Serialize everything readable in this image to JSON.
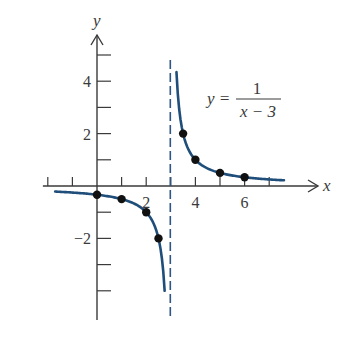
{
  "chart_data": {
    "type": "line",
    "title": "",
    "equation": {
      "lhs": "y =",
      "numerator": "1",
      "denominator": "x − 3"
    },
    "xlabel": "x",
    "ylabel": "y",
    "xlim": [
      -2.2,
      8.7
    ],
    "ylim": [
      -5.2,
      5.9
    ],
    "x_ticks": [
      -2,
      -1,
      0,
      1,
      2,
      3,
      4,
      5,
      6,
      7
    ],
    "x_tick_labels": [
      {
        "value": 2,
        "label": "2"
      },
      {
        "value": 4,
        "label": "4"
      },
      {
        "value": 6,
        "label": "6"
      }
    ],
    "y_ticks": [
      -4,
      -3,
      -2,
      -1,
      1,
      2,
      3,
      4,
      5
    ],
    "y_tick_labels": [
      {
        "value": 4,
        "label": "4"
      },
      {
        "value": 2,
        "label": "2"
      },
      {
        "value": -2,
        "label": "−2"
      }
    ],
    "grid": false,
    "legend": null,
    "asymptote": {
      "type": "vertical",
      "x": 3,
      "style": "dashed"
    },
    "series": [
      {
        "name": "left branch",
        "function": "1/(x-3)",
        "x_range": [
          -1.7,
          2.75
        ],
        "points": [
          {
            "x": 0,
            "y": -0.333
          },
          {
            "x": 1,
            "y": -0.5
          },
          {
            "x": 2,
            "y": -1
          },
          {
            "x": 2.5,
            "y": -2
          }
        ]
      },
      {
        "name": "right branch",
        "function": "1/(x-3)",
        "x_range": [
          3.23,
          7.6
        ],
        "points": [
          {
            "x": 3.5,
            "y": 2
          },
          {
            "x": 4,
            "y": 1
          },
          {
            "x": 5,
            "y": 0.5
          },
          {
            "x": 6,
            "y": 0.333
          }
        ]
      }
    ],
    "colors": {
      "curve": "#1f4e7a",
      "axes": "#3a3a3a",
      "points": "#111111",
      "asymptote": "#2c5684"
    }
  }
}
